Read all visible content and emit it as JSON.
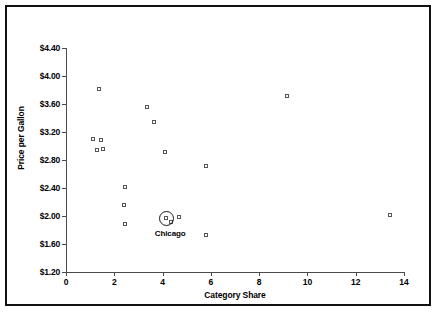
{
  "chart_data": {
    "type": "scatter",
    "title": "",
    "xlabel": "Category Share",
    "ylabel": "Price per Gallon",
    "xlim": [
      0,
      14
    ],
    "ylim": [
      1.2,
      4.4
    ],
    "xticks": [
      "0",
      "2",
      "4",
      "6",
      "8",
      "10",
      "12",
      "14"
    ],
    "xtick_values": [
      0,
      2,
      4,
      6,
      8,
      10,
      12,
      14
    ],
    "yticks": [
      "$1.20",
      "$1.60",
      "$2.00",
      "$2.40",
      "$2.80",
      "$3.20",
      "$3.60",
      "$4.00",
      "$4.40"
    ],
    "ytick_values": [
      1.2,
      1.6,
      2.0,
      2.4,
      2.8,
      3.2,
      3.6,
      4.0,
      4.4
    ],
    "grid": false,
    "legend": null,
    "marker": "open-square",
    "points": [
      {
        "x": 1.35,
        "y": 3.82
      },
      {
        "x": 1.1,
        "y": 3.1
      },
      {
        "x": 1.45,
        "y": 3.09
      },
      {
        "x": 1.3,
        "y": 2.94
      },
      {
        "x": 1.52,
        "y": 2.96
      },
      {
        "x": 2.45,
        "y": 2.41
      },
      {
        "x": 2.42,
        "y": 2.16
      },
      {
        "x": 2.43,
        "y": 1.88
      },
      {
        "x": 3.35,
        "y": 3.56
      },
      {
        "x": 3.65,
        "y": 3.35
      },
      {
        "x": 4.1,
        "y": 2.92
      },
      {
        "x": 4.15,
        "y": 1.97
      },
      {
        "x": 4.35,
        "y": 1.92
      },
      {
        "x": 4.7,
        "y": 1.99
      },
      {
        "x": 5.8,
        "y": 2.71
      },
      {
        "x": 5.8,
        "y": 1.73
      },
      {
        "x": 9.15,
        "y": 3.71
      },
      {
        "x": 13.4,
        "y": 2.01
      }
    ],
    "annotations": [
      {
        "label": "Chicago",
        "x": 4.15,
        "y": 1.97,
        "marker": "circled"
      }
    ]
  }
}
